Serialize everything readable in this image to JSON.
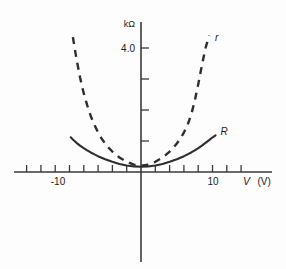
{
  "figure": {
    "name": "resistance-vs-voltage-plot",
    "background_color": "#fdfdfd",
    "ink_color": "#2e2e2e"
  },
  "chart_data": {
    "type": "line",
    "title": "",
    "subtitle": "",
    "xlabel": "V (V)",
    "ylabel": "kΩ",
    "xlim": [
      -13.2,
      16.5
    ],
    "ylim": [
      -3.2,
      4.9
    ],
    "grid": false,
    "legend": "inline-curve-labels",
    "x_axis": {
      "unit_label": "V (V)",
      "symbol": "V",
      "unit": "(V)",
      "tick_labels": [
        "-10",
        "10"
      ],
      "labeled_ticks": [
        -10,
        10
      ],
      "minor_ticks": [
        -12,
        -11,
        -10,
        -9,
        -8,
        -7,
        -6,
        -5,
        -4,
        -3,
        -2,
        -1,
        1,
        2,
        3,
        4,
        5,
        6,
        7,
        8,
        9,
        10,
        11,
        12
      ],
      "tick_interval": 1
    },
    "y_axis": {
      "unit_label": "kΩ",
      "tick_labels": [
        "4.0"
      ],
      "labeled_ticks": [
        4.0
      ],
      "minor_ticks": [
        1.0,
        2.0,
        3.0,
        4.0
      ],
      "tick_interval": 1.0
    },
    "series": [
      {
        "name": "r",
        "label": "r",
        "style": "dashed",
        "description": "small-signal dynamic resistance, steep U-shape",
        "x": [
          -9.5,
          -9.0,
          -8.5,
          -8.0,
          -7.5,
          -7.0,
          -6.5,
          -6.0,
          -5.5,
          -5.0,
          -4.5,
          -4.0,
          -3.5,
          -3.0,
          -2.0,
          -1.0,
          0.0,
          1.0,
          2.0,
          3.0,
          3.5,
          4.0,
          4.5,
          5.0,
          5.5,
          6.0,
          6.5,
          7.0,
          7.5,
          8.0,
          8.5,
          9.0,
          9.5
        ],
        "y": [
          4.35,
          3.65,
          3.05,
          2.55,
          2.15,
          1.8,
          1.52,
          1.28,
          1.08,
          0.92,
          0.78,
          0.66,
          0.56,
          0.47,
          0.33,
          0.24,
          0.2,
          0.24,
          0.33,
          0.47,
          0.56,
          0.66,
          0.78,
          0.92,
          1.08,
          1.28,
          1.52,
          1.85,
          2.3,
          2.85,
          3.45,
          4.0,
          4.4
        ]
      },
      {
        "name": "R",
        "label": "R",
        "style": "solid",
        "description": "static resistance, shallow U-shape",
        "x": [
          -9.8,
          -9.5,
          -9.0,
          -8.5,
          -8.0,
          -7.5,
          -7.0,
          -6.5,
          -6.0,
          -5.5,
          -5.0,
          -4.5,
          -4.0,
          -3.0,
          -2.0,
          -1.0,
          0.0,
          1.0,
          2.0,
          3.0,
          4.0,
          5.0,
          5.5,
          6.0,
          6.5,
          7.0,
          7.5,
          8.0,
          8.5,
          9.0,
          9.5,
          10.0,
          10.4
        ],
        "y": [
          1.12,
          1.05,
          0.94,
          0.85,
          0.77,
          0.7,
          0.63,
          0.57,
          0.51,
          0.46,
          0.41,
          0.37,
          0.33,
          0.26,
          0.21,
          0.18,
          0.17,
          0.18,
          0.21,
          0.26,
          0.33,
          0.41,
          0.46,
          0.51,
          0.57,
          0.63,
          0.7,
          0.77,
          0.85,
          0.94,
          1.03,
          1.12,
          1.18
        ]
      }
    ],
    "annotations": [
      {
        "text": "r",
        "x": 10.3,
        "y": 4.35,
        "style": "italic"
      },
      {
        "text": "R",
        "x": 11.1,
        "y": 1.32,
        "style": "italic"
      }
    ]
  }
}
